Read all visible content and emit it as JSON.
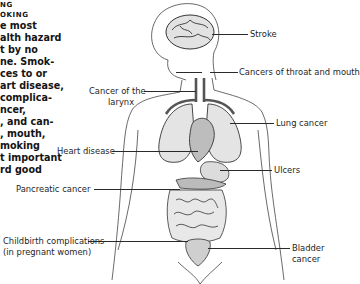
{
  "sidebar": {
    "heading_lines": [
      "NG",
      "OKING"
    ],
    "body_lines": [
      "e most",
      "alth hazard",
      "t by no",
      "ne. Smok-",
      "ces to or",
      "art disease,",
      "complica-",
      "ncer,",
      ", and can-",
      ", mouth,",
      "moking",
      "t important",
      "rd good"
    ]
  },
  "diagram": {
    "title": "",
    "labels": {
      "stroke": "Stroke",
      "throat_mouth": "Cancers of throat and mouth",
      "larynx_line1": "Cancer of the",
      "larynx_line2": "larynx",
      "lung": "Lung cancer",
      "heart": "Heart disease",
      "ulcers": "Ulcers",
      "pancreatic": "Pancreatic cancer",
      "childbirth_line1": "Childbirth complications",
      "childbirth_line2": "(in pregnant women)",
      "bladder_line1": "Bladder",
      "bladder_line2": "cancer"
    },
    "colors": {
      "line": "#2a2a2a",
      "organ_fill": "#d9d9d9",
      "vessel": "#555555"
    }
  }
}
